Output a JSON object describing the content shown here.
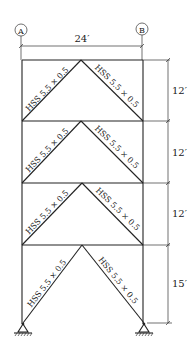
{
  "gridlines": [
    {
      "label": "A"
    },
    {
      "label": "B"
    }
  ],
  "span": "24′",
  "stories": [
    {
      "height": "12′",
      "left_brace": "HSS 5.5 × 0.5",
      "right_brace": "HSS 5.5 × 0.5"
    },
    {
      "height": "12′",
      "left_brace": "HSS 5.5 × 0.5",
      "right_brace": "HSS 5.5 × 0.5"
    },
    {
      "height": "12′",
      "left_brace": "HSS 5.5 × 0.5",
      "right_brace": "HSS 5.5 × 0.5"
    },
    {
      "height": "15′",
      "left_brace": "HSS 5.5 × 0.5",
      "right_brace": "HSS 5.5 × 0.5"
    }
  ]
}
